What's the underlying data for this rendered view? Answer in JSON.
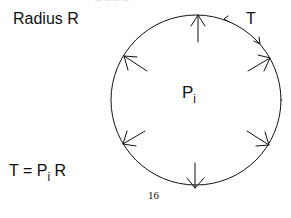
{
  "diagram": {
    "title": "Radius R",
    "center_label": {
      "main": "P",
      "sub": "i"
    },
    "tension_label": "T",
    "equation": {
      "lhs": "T = P",
      "sub": "i",
      "rhs": " R"
    },
    "page_number": "16",
    "top_cut_text": "... ... ... ...",
    "circle": {
      "cx": 196,
      "cy": 100,
      "r": 85,
      "stroke": "#111111"
    },
    "pressure_arrow_angles_deg": [
      90,
      45,
      0,
      -45,
      -90,
      -135,
      180,
      135
    ],
    "arrow_count": 8
  }
}
